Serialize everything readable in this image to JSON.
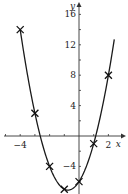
{
  "chart_data": {
    "type": "line",
    "title": "",
    "xlabel": "x",
    "ylabel": "y",
    "x_ticks_labeled": [
      -4,
      2
    ],
    "y_ticks_labeled": [
      16,
      12,
      8,
      4,
      -4
    ],
    "x_tick_step": 1,
    "y_tick_step": 2,
    "xlim": [
      -4.4,
      2.7
    ],
    "ylim": [
      -7.7,
      17.5
    ],
    "grid": false,
    "legend": null,
    "equation": "y = 2x^2 + 3x - 6",
    "curve": {
      "x_range": [
        -4,
        2.4
      ]
    },
    "points": {
      "marker": "x",
      "x": [
        -4,
        -3,
        -2,
        -1,
        0,
        1,
        2
      ],
      "y": [
        14,
        3,
        -4,
        -7,
        -6,
        -1,
        8
      ]
    }
  },
  "axis_labels": {
    "x": "x",
    "y": "y"
  },
  "tick_labels": {
    "x": [
      "−4",
      "2"
    ],
    "y": [
      "16",
      "12",
      "8",
      "4",
      "−4"
    ]
  },
  "colors": {
    "line": "#1a1a1a",
    "axis": "#333333",
    "background": "#ffffff"
  }
}
